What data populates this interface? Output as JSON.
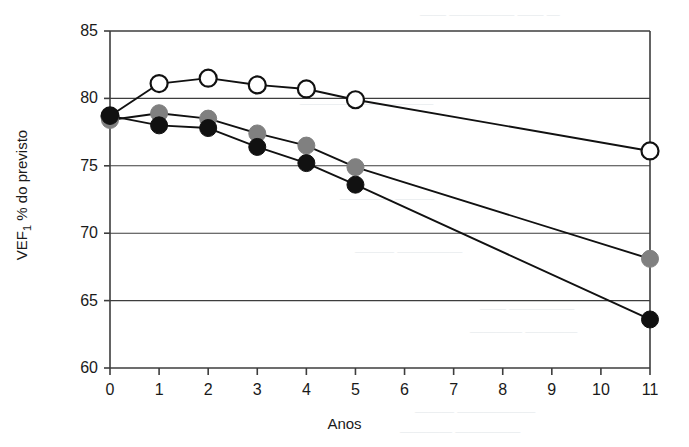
{
  "figure": {
    "xlabel": "Anos",
    "ylabel_main": "VEF",
    "ylabel_sub": "1",
    "ylabel_rest": " % do previsto"
  },
  "chart_data": {
    "type": "line",
    "title": "",
    "subtitle": "",
    "xlabel": "Anos",
    "ylabel": "VEF1 % do previsto",
    "xlim": [
      0,
      11
    ],
    "ylim": [
      60,
      85
    ],
    "xticks": [
      0,
      1,
      2,
      3,
      4,
      5,
      6,
      7,
      8,
      9,
      10,
      11
    ],
    "xticklabels": [
      "0",
      "1",
      "2",
      "3",
      "4",
      "5",
      "6",
      "7",
      "8",
      "9",
      "10",
      "11"
    ],
    "yticks": [
      60,
      65,
      70,
      75,
      80,
      85
    ],
    "yticklabels": [
      "60",
      "65",
      "70",
      "75",
      "80",
      "85"
    ],
    "grid": "horizontal",
    "legend": "none",
    "series": [
      {
        "name": "open-circle-series",
        "marker": "open-circle",
        "marker_fill": "#ffffff",
        "marker_edge": "#111111",
        "line_color": "#111111",
        "x": [
          0,
          1,
          2,
          3,
          4,
          5,
          11
        ],
        "values": [
          78.7,
          81.1,
          81.5,
          81.0,
          80.7,
          79.9,
          76.1
        ]
      },
      {
        "name": "gray-circle-series",
        "marker": "filled-circle",
        "marker_fill": "#808080",
        "marker_edge": "#808080",
        "line_color": "#111111",
        "x": [
          0,
          1,
          2,
          3,
          4,
          5,
          11
        ],
        "values": [
          78.4,
          78.9,
          78.5,
          77.4,
          76.5,
          74.9,
          68.1
        ]
      },
      {
        "name": "black-circle-series",
        "marker": "filled-circle",
        "marker_fill": "#111111",
        "marker_edge": "#111111",
        "line_color": "#111111",
        "x": [
          0,
          1,
          2,
          3,
          4,
          5,
          11
        ],
        "values": [
          78.7,
          78.0,
          77.8,
          76.4,
          75.2,
          73.6,
          63.6
        ]
      }
    ]
  },
  "bleed_text": {
    "l1": "— —— ————— ——",
    "l2": "———— ——————",
    "l3": "——— ————",
    "l4": "————— ———",
    "l5": "————— ——",
    "l6": "———— ————",
    "l7": "—————— ———",
    "l8": "————— ————"
  }
}
